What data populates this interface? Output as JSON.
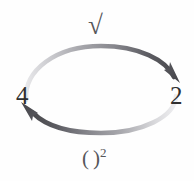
{
  "diagram": {
    "nodes": [
      {
        "id": "left",
        "label": "4"
      },
      {
        "id": "right",
        "label": "2"
      }
    ],
    "edges": [
      {
        "id": "top",
        "from": "4",
        "to": "2",
        "operation": "√",
        "label_open": "√",
        "direction": "clockwise-top",
        "arrow_position": "right"
      },
      {
        "id": "bottom",
        "from": "2",
        "to": "4",
        "operation": "( )^2",
        "label_open": "(",
        "label_close": ")",
        "label_exponent": "2",
        "direction": "clockwise-bottom",
        "arrow_position": "left"
      }
    ],
    "colors": {
      "ink_dark": "#4a4a4e",
      "ink_light": "#cfcfd2",
      "label_text": "#2f2f2f",
      "edge_text": "#56565a",
      "background": "#fefefe"
    },
    "geometry": {
      "ellipse_center_x": 101,
      "ellipse_center_y": 89,
      "ellipse_radius_x": 76,
      "ellipse_radius_y": 44
    }
  }
}
